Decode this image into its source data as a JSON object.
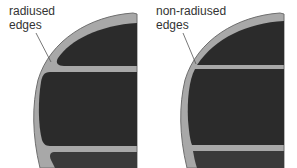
{
  "panels": [
    {
      "id": "radiused",
      "label_line1": "radiused",
      "label_line2": "edges",
      "edge_style": "radiused"
    },
    {
      "id": "non-radiused",
      "label_line1": "non-radiused",
      "label_line2": "edges",
      "edge_style": "non-radiused"
    }
  ],
  "colors": {
    "frame": "#a8a8a8",
    "frame_stroke": "#6e6e6e",
    "fill": "#2b2b2b",
    "background": "#ffffff",
    "leader_line": "#555555",
    "text": "#333333"
  }
}
